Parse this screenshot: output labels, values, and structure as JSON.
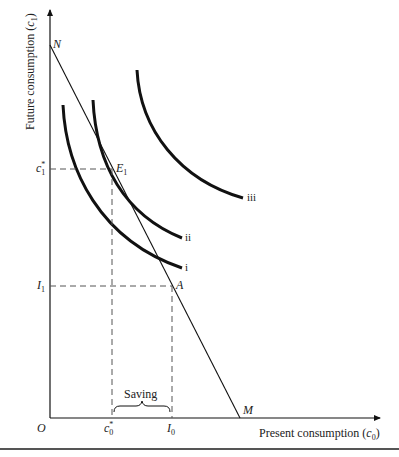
{
  "diagram": {
    "y_axis_label": "Future consumption (",
    "y_axis_var": "c",
    "y_axis_sub": "1",
    "y_axis_close": ")",
    "x_axis_label": "Present consumption (",
    "x_axis_var": "c",
    "x_axis_sub": "0",
    "x_axis_close": ")",
    "origin": "O",
    "points": {
      "N": "N",
      "M": "M",
      "E1": "E",
      "E1_sub": "1",
      "A": "A"
    },
    "y_ticks": {
      "c1_star_var": "c",
      "c1_star_sup": "*",
      "c1_star_sub": "1",
      "I1_var": "I",
      "I1_sub": "1"
    },
    "x_ticks": {
      "c0_star_var": "c",
      "c0_star_sup": "*",
      "c0_star_sub": "0",
      "I0_var": "I",
      "I0_sub": "0"
    },
    "curves": [
      {
        "name": "i",
        "label": "i"
      },
      {
        "name": "ii",
        "label": "ii"
      },
      {
        "name": "iii",
        "label": "iii"
      }
    ],
    "brace_label": "Saving",
    "colors": {
      "ink": "#111111",
      "dashed": "#555555",
      "rule": "#555555"
    }
  }
}
